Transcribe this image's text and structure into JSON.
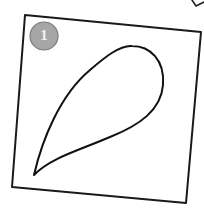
{
  "figure": {
    "badge": {
      "number": "1",
      "fill_color": "#a6a6a6",
      "stroke_color": "#7a7a7a",
      "text_color": "#f2f2f2"
    },
    "frame": {
      "shape": "tilted-square",
      "stroke_color": "#1a1a1a"
    },
    "drawing": {
      "shape": "teardrop",
      "stroke_color": "#111111"
    },
    "corner_mark": {
      "shape": "partial-stroke"
    }
  }
}
